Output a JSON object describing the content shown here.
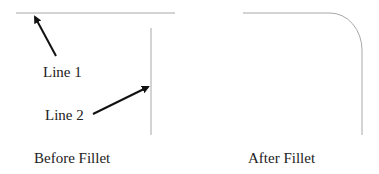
{
  "diagram": {
    "before": {
      "caption": "Before Fillet",
      "labels": {
        "line1": "Line 1",
        "line2": "Line 2"
      },
      "line1": {
        "x1": 16,
        "y1": 13,
        "x2": 175,
        "y2": 13
      },
      "line2": {
        "x1": 151,
        "y1": 28,
        "x2": 151,
        "y2": 135
      },
      "arrow1": {
        "x1": 56,
        "y1": 56,
        "x2": 35,
        "y2": 16
      },
      "arrow2": {
        "x1": 93,
        "y1": 114,
        "x2": 149,
        "y2": 86
      }
    },
    "after": {
      "caption": "After Fillet",
      "path": "M 243 13 L 330 13 A 32 37 0 0 1 362 50 L 362 135"
    },
    "colors": {
      "geometry_line": "#a8a8a8",
      "arrow": "#111111",
      "text": "#222222"
    }
  }
}
